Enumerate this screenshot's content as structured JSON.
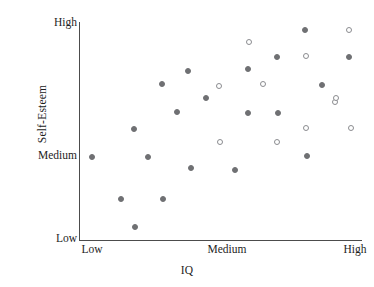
{
  "chart_data": {
    "type": "scatter",
    "title": "",
    "xlabel": "IQ",
    "ylabel": "Self-Esteem",
    "grid": false,
    "legend": "none",
    "xticks": [
      "Low",
      "Medium",
      "High"
    ],
    "yticks": [
      "Low",
      "Medium",
      "High"
    ],
    "xtick_positions": [
      92,
      227,
      355
    ],
    "ytick_positions": [
      238,
      155,
      22
    ],
    "xlim": [
      "Low",
      "High"
    ],
    "ylim": [
      "Low",
      "High"
    ],
    "marker_colors": {
      "filled": "#6f7073",
      "open_edge": "#8b8c90",
      "axis": "#4c4c4c"
    },
    "series": [
      {
        "name": "filled",
        "marker": "filled-circle",
        "points": [
          {
            "x": 92,
            "y": 157
          },
          {
            "x": 121,
            "y": 199
          },
          {
            "x": 134,
            "y": 129
          },
          {
            "x": 135,
            "y": 227
          },
          {
            "x": 148,
            "y": 157
          },
          {
            "x": 162,
            "y": 84
          },
          {
            "x": 163,
            "y": 199
          },
          {
            "x": 177,
            "y": 112
          },
          {
            "x": 188,
            "y": 71
          },
          {
            "x": 191,
            "y": 168
          },
          {
            "x": 206,
            "y": 98
          },
          {
            "x": 235,
            "y": 170
          },
          {
            "x": 248,
            "y": 69
          },
          {
            "x": 248,
            "y": 113
          },
          {
            "x": 277,
            "y": 57
          },
          {
            "x": 278,
            "y": 113
          },
          {
            "x": 305,
            "y": 30
          },
          {
            "x": 307,
            "y": 156
          },
          {
            "x": 322,
            "y": 85
          },
          {
            "x": 349,
            "y": 57
          }
        ]
      },
      {
        "name": "open",
        "marker": "open-circle",
        "points": [
          {
            "x": 219,
            "y": 86
          },
          {
            "x": 220,
            "y": 142
          },
          {
            "x": 249,
            "y": 42
          },
          {
            "x": 263,
            "y": 84
          },
          {
            "x": 277,
            "y": 142
          },
          {
            "x": 306,
            "y": 56
          },
          {
            "x": 306,
            "y": 128
          },
          {
            "x": 335,
            "y": 102
          },
          {
            "x": 336,
            "y": 98
          },
          {
            "x": 349,
            "y": 30
          },
          {
            "x": 351,
            "y": 128
          }
        ]
      }
    ]
  },
  "axes": {
    "y_title": "Self-Esteem",
    "x_title": "IQ",
    "y_labels": [
      "High",
      "Medium",
      "Low"
    ],
    "x_labels": [
      "Low",
      "Medium",
      "High"
    ]
  }
}
